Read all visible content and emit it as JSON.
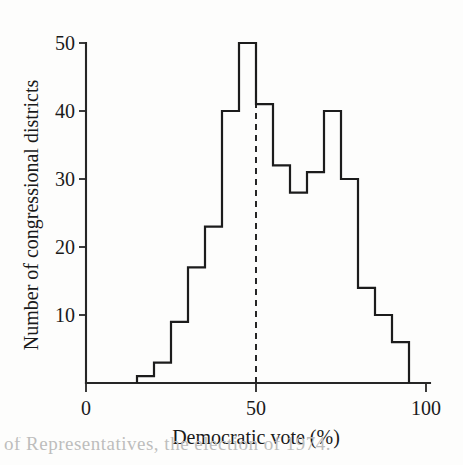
{
  "figure": {
    "background_color": "#fdfdfc",
    "line_color": "#1c1c1c",
    "caption_fragment": "of Representatives, the election of 1974."
  },
  "chart_data": {
    "type": "bar",
    "title": "",
    "subtitle": "",
    "xlabel": "Democratic vote (%)",
    "ylabel": "Number of congressional districts",
    "xlim": [
      0,
      100
    ],
    "ylim": [
      0,
      50
    ],
    "grid": false,
    "legend": null,
    "bin_width": 5,
    "x_ticks": [
      0,
      50,
      100
    ],
    "x_tick_labels": [
      "0",
      "50",
      "100"
    ],
    "y_ticks": [
      10,
      20,
      30,
      40,
      50
    ],
    "y_tick_labels": [
      "10",
      "20",
      "30",
      "40",
      "50"
    ],
    "bin_edges": [
      15,
      20,
      25,
      30,
      35,
      40,
      45,
      50,
      55,
      60,
      65,
      70,
      75,
      80,
      85,
      90,
      95
    ],
    "categories": [
      "15-20",
      "20-25",
      "25-30",
      "30-35",
      "35-40",
      "40-45",
      "45-50",
      "50-55",
      "55-60",
      "60-65",
      "65-70",
      "70-75",
      "75-80",
      "80-85",
      "85-90",
      "90-95"
    ],
    "values": [
      1,
      3,
      9,
      17,
      23,
      40,
      50,
      41,
      32,
      28,
      31,
      40,
      30,
      14,
      10,
      6
    ],
    "annotations": [
      {
        "name": "fifty-percent-reference-line",
        "type": "vline",
        "x": 50,
        "style": "dashed",
        "label": ""
      }
    ]
  }
}
